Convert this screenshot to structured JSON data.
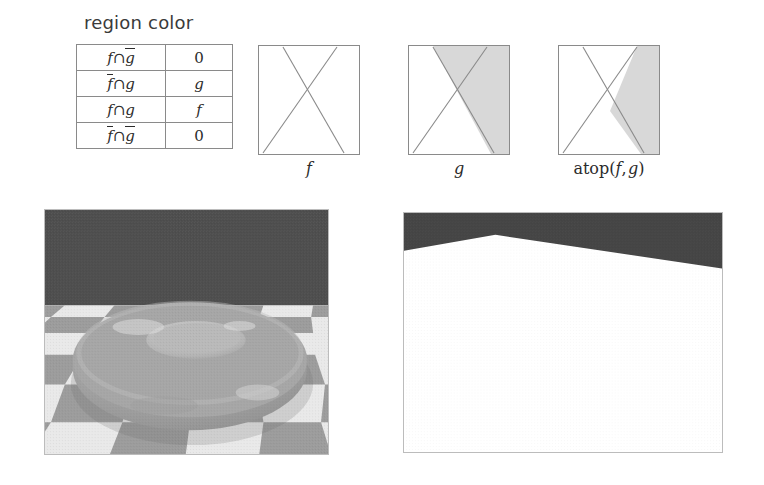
{
  "figure": {
    "table": {
      "caption": "region color",
      "columns": [
        "region",
        "color"
      ],
      "rows": [
        {
          "region": "f ∩ ġ",
          "value": "0"
        },
        {
          "region": "ƒ̄ ∩ g",
          "value": "g"
        },
        {
          "region": "f ∩ g",
          "value": "f"
        },
        {
          "region": "ƒ̄ ∩ ġ",
          "value": "0"
        }
      ],
      "cells": {
        "r0_f": "f",
        "r0_cap": "∩",
        "r0_g": "g",
        "r0_val": "0",
        "r1_f": "f",
        "r1_cap": "∩",
        "r1_g": "g",
        "r1_val": "g",
        "r2_f": "f",
        "r2_cap": "∩",
        "r2_g": "g",
        "r2_val": "f",
        "r3_f": "f",
        "r3_cap": "∩",
        "r3_g": "g",
        "r3_val": "0"
      }
    },
    "diagrams": [
      {
        "id": "f",
        "label": "f",
        "label_plain": "f",
        "description": "square with bowtie X outline, unshaded"
      },
      {
        "id": "g",
        "label": "g",
        "label_plain": "g",
        "description": "square with bowtie X outline, right wedge region shaded gray"
      },
      {
        "id": "atop",
        "label": "atop( f , g )",
        "label_prefix": "atop(",
        "label_arg1": "f",
        "label_comma": ",",
        "label_arg2": "g",
        "label_suffix": ")",
        "description": "square with bowtie X outline, g shaded only where it overlaps f"
      }
    ]
  },
  "renders": [
    {
      "id": "torus",
      "description": "rendered gray torus resting on checkerboard floor with dark gray backdrop",
      "alt": "torus-render"
    },
    {
      "id": "matte",
      "description": "matte/alpha image: dark gray backdrop above a white silhouette region",
      "alt": "matte-render"
    }
  ],
  "colors": {
    "backdrop_gray": "#4e4e4e",
    "floor_light": "#e8e8e8",
    "floor_dark": "#9a9a9a",
    "torus_gray": "#9e9e9e",
    "torus_highlight": "#d8d8d8",
    "shade_gray": "#d6d6d6",
    "line_gray": "#8a8a8a",
    "border_gray": "#bcbcbc",
    "text_dark": "#2b2b2b"
  }
}
